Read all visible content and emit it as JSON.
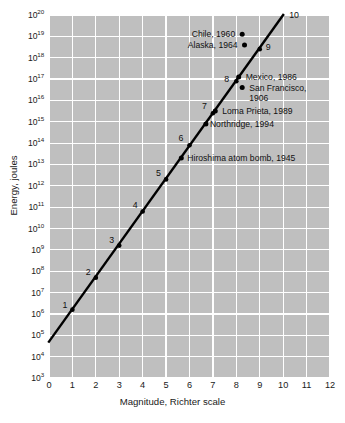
{
  "chart_data": {
    "type": "line",
    "title": "",
    "xlabel": "Magnitude, Richter scale",
    "ylabel": "Energy, joules",
    "xlim": [
      0,
      12
    ],
    "ylim_exponent": [
      3,
      20
    ],
    "yscale": "log",
    "grid": true,
    "legend": "none",
    "xticks": [
      "0",
      "1",
      "2",
      "3",
      "4",
      "5",
      "6",
      "7",
      "8",
      "9",
      "10",
      "11",
      "12"
    ],
    "yticks": [
      {
        "base": "10",
        "exp": "3"
      },
      {
        "base": "10",
        "exp": "4"
      },
      {
        "base": "10",
        "exp": "5"
      },
      {
        "base": "10",
        "exp": "6"
      },
      {
        "base": "10",
        "exp": "7"
      },
      {
        "base": "10",
        "exp": "8"
      },
      {
        "base": "10",
        "exp": "9"
      },
      {
        "base": "10",
        "exp": "10"
      },
      {
        "base": "10",
        "exp": "11"
      },
      {
        "base": "10",
        "exp": "12"
      },
      {
        "base": "10",
        "exp": "13"
      },
      {
        "base": "10",
        "exp": "14"
      },
      {
        "base": "10",
        "exp": "15"
      },
      {
        "base": "10",
        "exp": "16"
      },
      {
        "base": "10",
        "exp": "17"
      },
      {
        "base": "10",
        "exp": "18"
      },
      {
        "base": "10",
        "exp": "19"
      },
      {
        "base": "10",
        "exp": "20"
      }
    ],
    "series": [
      {
        "name": "energy-magnitude relation",
        "x": [
          0,
          10
        ],
        "y_exponent": [
          4.7,
          20.0
        ],
        "style": "solid-black-line"
      }
    ],
    "magnitude_markers": [
      {
        "label": "1",
        "x": 1.0,
        "y_exponent": 6.2
      },
      {
        "label": "2",
        "x": 2.0,
        "y_exponent": 7.7
      },
      {
        "label": "3",
        "x": 3.0,
        "y_exponent": 9.2
      },
      {
        "label": "4",
        "x": 4.0,
        "y_exponent": 10.8
      },
      {
        "label": "5",
        "x": 5.0,
        "y_exponent": 12.3
      },
      {
        "label": "6",
        "x": 6.0,
        "y_exponent": 13.9
      },
      {
        "label": "7",
        "x": 7.0,
        "y_exponent": 15.4
      },
      {
        "label": "8",
        "x": 8.0,
        "y_exponent": 16.9
      },
      {
        "label": "9",
        "x": 9.0,
        "y_exponent": 18.4
      },
      {
        "label": "10",
        "x": 10.0,
        "y_exponent": 20.0
      }
    ],
    "events": [
      {
        "name": "Chile, 1960",
        "x": 8.25,
        "y_exponent": 19.1,
        "label_side": "left"
      },
      {
        "name": "Alaska, 1964",
        "x": 8.35,
        "y_exponent": 18.6,
        "label_side": "left"
      },
      {
        "name": "Mexico, 1986",
        "x": 8.1,
        "y_exponent": 17.1,
        "label_side": "right"
      },
      {
        "name": "San Francisco,",
        "x": 8.25,
        "y_exponent": 16.6,
        "label_side": "right"
      },
      {
        "name": "1906",
        "x": 8.25,
        "y_exponent": 16.6,
        "label_side": "right-continuation"
      },
      {
        "name": "Loma Prieta, 1989",
        "x": 7.1,
        "y_exponent": 15.5,
        "label_side": "right"
      },
      {
        "name": "Northridge, 1994",
        "x": 6.7,
        "y_exponent": 14.9,
        "label_side": "right"
      },
      {
        "name": "Hiroshima atom bomb, 1945",
        "x": 5.65,
        "y_exponent": 13.3,
        "label_side": "right"
      }
    ],
    "colors": {
      "plot_background": "#bfbfbf",
      "gridline": "#ffffff",
      "line": "#000000",
      "marker": "#000000",
      "text": "#1a1a1a",
      "page_background": "#ffffff"
    }
  }
}
